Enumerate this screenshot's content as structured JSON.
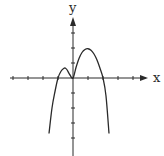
{
  "chart_data": {
    "type": "line",
    "title": "",
    "xlabel": "x",
    "ylabel": "y",
    "grid": false,
    "legend": null,
    "xlim": [
      -4,
      5
    ],
    "ylim": [
      -5,
      4
    ],
    "x_ticks": [
      -4,
      -3,
      -2,
      -1,
      1,
      2,
      3,
      4
    ],
    "y_ticks": [
      -4,
      -3,
      -2,
      -1,
      1,
      2,
      3
    ],
    "series": [
      {
        "name": "f(x)",
        "x": [
          -1.6,
          -1.4,
          -1.2,
          -1.0,
          -0.8,
          -0.6,
          -0.5,
          -0.4,
          -0.2,
          0.0,
          0.2,
          0.4,
          0.6,
          0.8,
          1.0,
          1.2,
          1.4,
          1.6,
          1.8,
          2.0,
          2.2,
          2.4
        ],
        "y": [
          -3.7,
          -2.0,
          -0.9,
          0.0,
          0.45,
          0.65,
          0.65,
          0.55,
          0.2,
          0.0,
          0.7,
          1.3,
          1.7,
          1.9,
          1.95,
          1.85,
          1.6,
          1.2,
          0.65,
          0.0,
          -1.2,
          -3.7
        ]
      }
    ],
    "annotations": [
      "x-axis crossings at x = -1, 0 (touch) and x = 2",
      "local maxima near (-0.5, 0.65) and (1, 1.95)",
      "both ends go to -infinity"
    ]
  },
  "labels": {
    "x_axis": "x",
    "y_axis": "y"
  },
  "colors": {
    "ink": "#2a2a2a",
    "background": "#ffffff"
  }
}
